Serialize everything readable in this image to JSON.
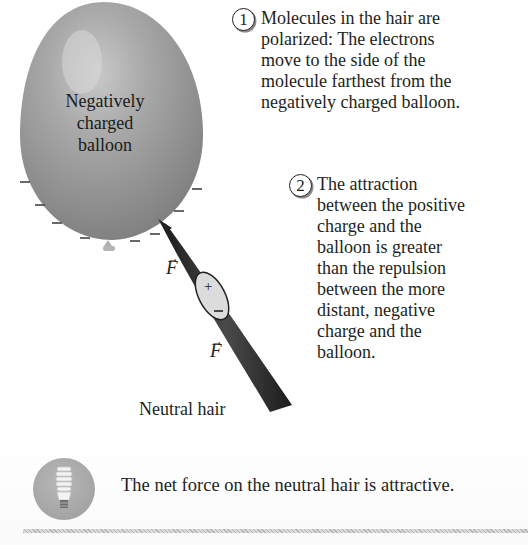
{
  "figure": {
    "balloon": {
      "label_lines": [
        "Negatively",
        "charged",
        "balloon"
      ],
      "surface_charge_symbol": "−",
      "color": "#9a9a9a"
    },
    "hair": {
      "label": "Neutral hair",
      "color": "#2a2a2a",
      "polarized_region": {
        "positive_symbol": "+",
        "negative_symbol": "−"
      }
    },
    "forces": [
      {
        "symbol": "F",
        "arrow": "→",
        "description": "attractive force on positive end"
      },
      {
        "symbol": "F",
        "arrow": "→",
        "description": "repulsive force on negative end"
      }
    ],
    "notes": [
      {
        "number": "1",
        "lines": [
          "Molecules in the hair are",
          "polarized: The electrons",
          "move to the side of the",
          "molecule farthest from the",
          "negatively charged balloon."
        ]
      },
      {
        "number": "2",
        "lines": [
          "The attraction",
          "between the positive",
          "charge and the",
          "balloon is greater",
          "than the repulsion",
          "between the more",
          "distant, negative",
          "charge and the",
          "balloon."
        ]
      }
    ]
  },
  "summary": {
    "icon": "lightbulb-icon",
    "text": "The net force on the neutral hair is attractive."
  }
}
